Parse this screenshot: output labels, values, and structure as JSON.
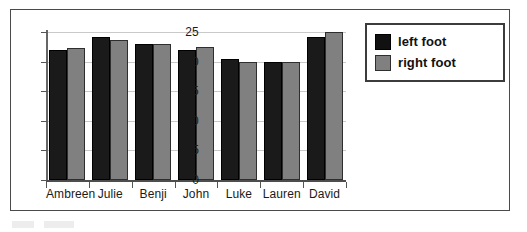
{
  "chart_data": {
    "type": "bar",
    "title": "",
    "xlabel": "",
    "ylabel": "",
    "ylim": [
      0,
      25
    ],
    "yticks": [
      0,
      5,
      10,
      15,
      20,
      25
    ],
    "ytick_labels": [
      "0",
      "5",
      "10",
      "15",
      "20",
      "25"
    ],
    "grid": true,
    "legend_position": "right",
    "categories": [
      "Ambreen",
      "Julie",
      "Benji",
      "John",
      "Luke",
      "Lauren",
      "David"
    ],
    "series": [
      {
        "name": "left foot",
        "color": "#1a1a1a",
        "values": [
          22,
          24.2,
          23,
          22,
          20.5,
          20,
          24.2
        ]
      },
      {
        "name": "right foot",
        "color": "#808080",
        "values": [
          22.3,
          23.7,
          23,
          22.5,
          20,
          20,
          25
        ]
      }
    ]
  },
  "legend": {
    "items": [
      {
        "label": "left foot",
        "swatch": "black-swatch-icon"
      },
      {
        "label": "right foot",
        "swatch": "gray-swatch-icon"
      }
    ]
  },
  "colors": {
    "left_foot": "#1a1a1a",
    "right_foot": "#808080",
    "frame": "#4a4a4a",
    "gridline": "#c9c9c9",
    "axis": "#555555",
    "text": "#1a1a1a"
  }
}
